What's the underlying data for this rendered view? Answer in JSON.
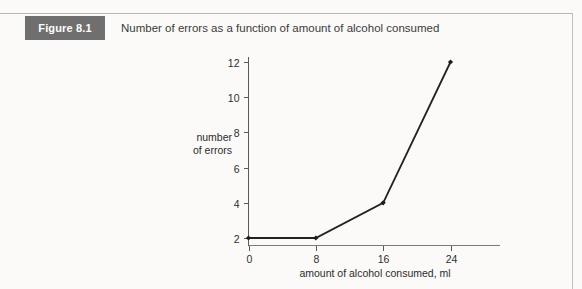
{
  "figure": {
    "tag": "Figure 8.1",
    "caption": "Number of errors as a function of amount of alcohol consumed"
  },
  "colors": {
    "tag_box_bg": "#6f6f6f",
    "tag_box_text": "#ffffff",
    "page_bg": "#fbfaf8",
    "line": "#222222",
    "marker": "#1c1c1c",
    "axis": "#5a5a5a",
    "rule": "#b9b7b4"
  },
  "chart_data": {
    "type": "line",
    "title": "Number of errors as a function of amount of alcohol consumed",
    "xlabel": "amount of alcohol consumed, ml",
    "ylabel": "number of errors",
    "ylabel_lines": [
      "number",
      "of errors"
    ],
    "x": [
      0,
      8,
      16,
      24
    ],
    "values": [
      2,
      2,
      4,
      12
    ],
    "xticks": [
      0,
      8,
      16,
      24
    ],
    "xtick_labels": [
      "0",
      "8",
      "16",
      "24"
    ],
    "yticks": [
      2,
      4,
      6,
      8,
      10,
      12
    ],
    "ytick_labels": [
      "2",
      "4",
      "6",
      "8",
      "10",
      "12"
    ],
    "xlim": [
      0,
      28
    ],
    "ylim": [
      0,
      13
    ],
    "grid": false,
    "legend": null,
    "markers": "diamond"
  }
}
